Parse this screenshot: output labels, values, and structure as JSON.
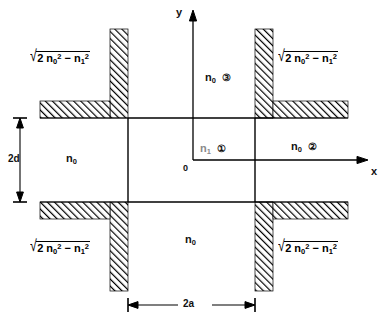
{
  "figure": {
    "type": "waveguide-cross-section-diagram",
    "axes": {
      "x_label": "x",
      "y_label": "y",
      "origin_label": "0"
    },
    "dimensions": [
      {
        "name": "vertical-thickness",
        "label": "2d"
      },
      {
        "name": "horizontal-width",
        "label": "2a"
      }
    ],
    "regions": [
      {
        "id": "core",
        "index_label": "n",
        "index_sub": "1",
        "marker": "①",
        "position": "center"
      },
      {
        "id": "right",
        "index_label": "n",
        "index_sub": "0",
        "marker": "②",
        "position": "right-middle"
      },
      {
        "id": "top",
        "index_label": "n",
        "index_sub": "0",
        "marker": "③",
        "position": "top-center"
      },
      {
        "id": "left",
        "index_label": "n",
        "index_sub": "0",
        "marker": "",
        "position": "left-middle"
      },
      {
        "id": "bottom",
        "index_label": "n",
        "index_sub": "0",
        "marker": "",
        "position": "bottom-center"
      }
    ],
    "corner_formula": {
      "radical": "√",
      "body_prefix": "2 n",
      "body_sub_a": "0",
      "body_sup_a": "2",
      "body_minus": "− n",
      "body_sub_b": "1",
      "body_sup_b": "2"
    },
    "corners": [
      "top-left",
      "top-right",
      "bottom-left",
      "bottom-right"
    ],
    "colors": {
      "line": "#000000",
      "hatch": "#000000",
      "background": "#ffffff",
      "faded_text": "#8a8a8a"
    },
    "caption": ""
  }
}
